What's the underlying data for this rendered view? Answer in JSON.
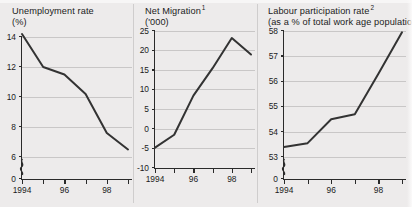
{
  "page": {
    "background_color": "#edebeb",
    "ink_color": "#2a2a2a",
    "grid_color": "#c9c7c7"
  },
  "chart_data": [
    {
      "type": "line",
      "panel": "unemployment",
      "title": "Unemployment rate",
      "subtitle": "(%)",
      "title_superscript": "",
      "xlabel": "",
      "ylabel": "",
      "x": [
        1994,
        1995,
        1996,
        1997,
        1998,
        1999
      ],
      "categories": [
        "1994",
        "95",
        "96",
        "97",
        "98",
        "99"
      ],
      "xtick_labels": [
        "1994",
        "",
        "96",
        "",
        "98",
        ""
      ],
      "values": [
        14.2,
        12.0,
        11.5,
        10.2,
        7.6,
        6.5
      ],
      "yticks": [
        14,
        12,
        10,
        8,
        6
      ],
      "ytick_labels": [
        "14",
        "12",
        "10",
        "8",
        "6"
      ],
      "zero_label": "0",
      "ylim": [
        6,
        14.4
      ],
      "axis_break": true,
      "grid": true,
      "legend": "none"
    },
    {
      "type": "line",
      "panel": "net-migration",
      "title": "Net Migration",
      "subtitle": "('000)",
      "title_superscript": "1",
      "xlabel": "",
      "ylabel": "",
      "x": [
        1994,
        1995,
        1996,
        1997,
        1998,
        1999
      ],
      "categories": [
        "1994",
        "95",
        "96",
        "97",
        "98",
        "99"
      ],
      "xtick_labels": [
        "1994",
        "",
        "96",
        "",
        "98",
        ""
      ],
      "values": [
        -4.8,
        -1.5,
        8.5,
        15.5,
        23.2,
        19.0
      ],
      "yticks": [
        25,
        20,
        15,
        10,
        5,
        0,
        -5,
        -10
      ],
      "ytick_labels": [
        "25",
        "20",
        "15",
        "10",
        "5",
        "0",
        "-5",
        "-10"
      ],
      "zero_label": "",
      "ylim": [
        -10,
        25
      ],
      "axis_break": false,
      "grid": true,
      "legend": "none"
    },
    {
      "type": "line",
      "panel": "labour-participation",
      "title": "Labour participation rate",
      "subtitle": "(as a % of total work age population)",
      "title_superscript": "2",
      "xlabel": "",
      "ylabel": "",
      "x": [
        1994,
        1995,
        1996,
        1997,
        1998,
        1999
      ],
      "categories": [
        "1994",
        "95",
        "96",
        "97",
        "98",
        "99"
      ],
      "xtick_labels": [
        "1994",
        "",
        "96",
        "",
        "98",
        ""
      ],
      "values": [
        53.4,
        53.55,
        54.5,
        54.7,
        56.3,
        57.95
      ],
      "yticks": [
        58,
        57,
        56,
        55,
        54,
        53
      ],
      "ytick_labels": [
        "58",
        "57",
        "56",
        "55",
        "54",
        "53"
      ],
      "zero_label": "0",
      "ylim": [
        53,
        58
      ],
      "axis_break": true,
      "grid": true,
      "legend": "none"
    }
  ]
}
